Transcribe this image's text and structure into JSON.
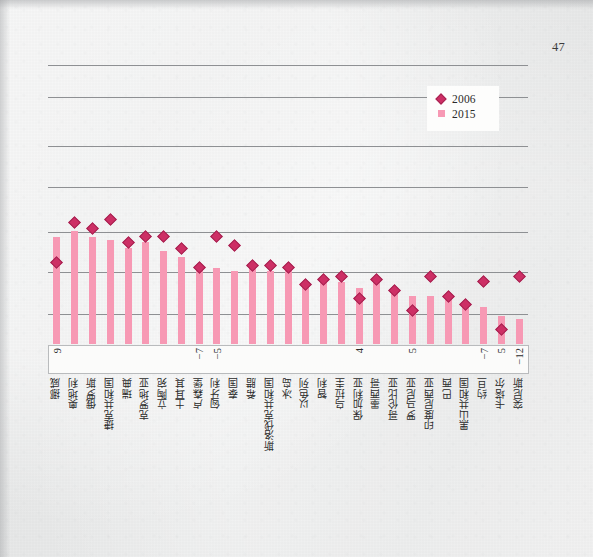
{
  "page": {
    "folio": "47",
    "paper_color": "#e9eaea"
  },
  "legend": {
    "items": [
      {
        "label": "2006",
        "marker": "diamond",
        "color": "#cd2f65"
      },
      {
        "label": "2015",
        "marker": "square",
        "color": "#f799b4"
      }
    ]
  },
  "chart_data": {
    "type": "bar",
    "title": "",
    "subtitle": "",
    "xlabel": "",
    "ylabel": "",
    "grid": true,
    "gridlines": 7,
    "legend_position": "top-right",
    "ylim": [
      0,
      100
    ],
    "categories": [
      "挪威",
      "奥地利",
      "俄罗斯",
      "捷克共和国",
      "瑞典",
      "克罗地亚",
      "立陶宛",
      "土耳其",
      "卢森堡",
      "匈牙利",
      "泰国",
      "希腊",
      "斯洛伐克共和国",
      "冰岛",
      "以色列",
      "智利",
      "乌拉圭",
      "保加利亚",
      "墨西哥",
      "哥伦比亚",
      "罗马尼亚",
      "印度尼西亚",
      "巴西",
      "黑山共和国",
      "约旦",
      "卡塔尔",
      "突尼斯"
    ],
    "series": [
      {
        "name": "2015",
        "marker": "bar",
        "color": "#f799b4",
        "values": [
          38,
          40,
          38,
          37,
          34,
          36,
          33,
          31,
          28,
          27,
          26,
          27,
          26,
          26,
          22,
          22,
          22,
          20,
          22,
          18,
          17,
          17,
          16,
          14,
          13,
          10,
          9
        ]
      },
      {
        "name": "2006",
        "marker": "diamond",
        "color": "#cd2f65",
        "values": [
          29,
          43,
          41,
          44,
          36,
          38,
          38,
          34,
          27,
          38,
          35,
          28,
          28,
          27,
          21,
          23,
          24,
          16,
          23,
          19,
          12,
          24,
          17,
          14,
          22,
          5,
          24
        ]
      }
    ],
    "value_labels": [
      {
        "category_index": 0,
        "text": "9"
      },
      {
        "category_index": 8,
        "text": "−7"
      },
      {
        "category_index": 9,
        "text": "−5"
      },
      {
        "category_index": 17,
        "text": "4"
      },
      {
        "category_index": 20,
        "text": "5"
      },
      {
        "category_index": 24,
        "text": "−7"
      },
      {
        "category_index": 25,
        "text": "5"
      },
      {
        "category_index": 26,
        "text": "−12"
      }
    ]
  }
}
